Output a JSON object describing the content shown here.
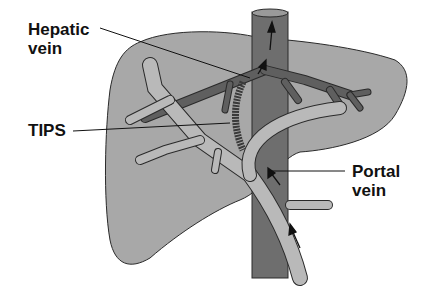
{
  "diagram": {
    "labels": {
      "hepatic_vein_line1": "Hepatic",
      "hepatic_vein_line2": "vein",
      "tips": "TIPS",
      "portal_vein_line1": "Portal",
      "portal_vein_line2": "vein"
    },
    "colors": {
      "liver": "#a8a8a8",
      "ivc": "#6e6e6e",
      "hepatic_vein": "#5f5f5f",
      "portal_vein": "#b9b9b9",
      "outline": "#2a2a2a",
      "stent": "#3a3a3a"
    }
  }
}
